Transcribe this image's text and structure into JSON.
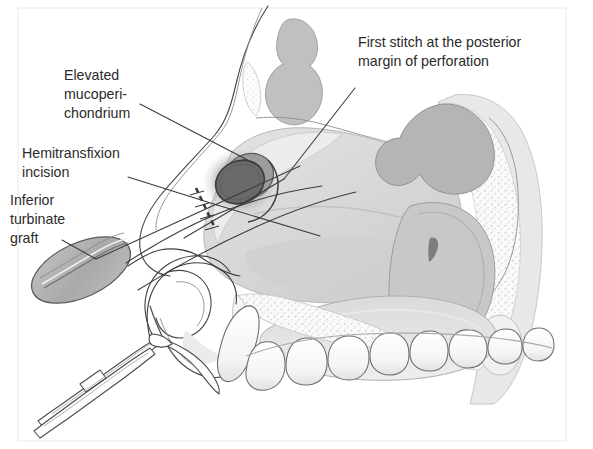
{
  "figure": {
    "background_color": "#ffffff",
    "width": 593,
    "height": 449
  },
  "palette": {
    "text": "#2b2b2b",
    "leader_line": "#3a3a3a",
    "outline": "#4a4a4a",
    "tissue_light": "#dcdcdc",
    "tissue_mid": "#c4c4c4",
    "tissue_dark": "#b0b0b0",
    "bone_speckle": "#efefef",
    "perforation_dark": "#5a5a5a",
    "graft_fill": "#aeaeae",
    "tooth_fill": "#fbfbfb",
    "frame": "#ebebeb"
  },
  "annotations": [
    {
      "id": "elevated-mucoperichondrium",
      "lines": [
        "Elevated",
        "mucoperi-",
        "chondrium"
      ],
      "text_anchor": "start",
      "x": 64,
      "y": 80,
      "line_height": 19,
      "leader": {
        "x1": 140,
        "y1": 104,
        "x2": 259,
        "y2": 166
      }
    },
    {
      "id": "first-stitch-posterior-margin",
      "lines": [
        "First stitch at the posterior",
        "margin of perforation"
      ],
      "text_anchor": "start",
      "x": 358,
      "y": 47,
      "line_height": 19,
      "leader": {
        "x1": 355,
        "y1": 88,
        "x2": 284,
        "y2": 179
      }
    },
    {
      "id": "hemitransfixion-incision",
      "lines": [
        "Hemitransfixion",
        "incision"
      ],
      "text_anchor": "start",
      "x": 22,
      "y": 158,
      "line_height": 19,
      "leader": {
        "x1": 128,
        "y1": 177,
        "x2": 217,
        "y2": 205
      }
    },
    {
      "id": "inferior-turbinate-graft",
      "lines": [
        "Inferior",
        "turbinate",
        "graft"
      ],
      "text_anchor": "start",
      "x": 10,
      "y": 205,
      "line_height": 19,
      "leader": {
        "x1": 62,
        "y1": 240,
        "x2": 96,
        "y2": 259
      }
    }
  ],
  "structures": [
    {
      "id": "facial-profile",
      "label": "facial soft tissue profile"
    },
    {
      "id": "frontal-sinus",
      "label": "frontal sinus"
    },
    {
      "id": "nasal-bone",
      "label": "nasal bone"
    },
    {
      "id": "nasal-septum",
      "label": "nasal septum"
    },
    {
      "id": "septal-perforation",
      "label": "septal perforation"
    },
    {
      "id": "mucoperichondrial-flap",
      "label": "elevated mucoperichondrial flap"
    },
    {
      "id": "sphenoid-sinus",
      "label": "sphenoid sinus"
    },
    {
      "id": "nasopharynx",
      "label": "nasopharynx"
    },
    {
      "id": "soft-palate",
      "label": "soft palate"
    },
    {
      "id": "hard-palate",
      "label": "hard palate"
    },
    {
      "id": "upper-teeth",
      "label": "upper dental arch"
    },
    {
      "id": "upper-lip",
      "label": "upper lip"
    },
    {
      "id": "columella",
      "label": "columella"
    },
    {
      "id": "inferior-turbinate-graft-body",
      "label": "harvested inferior turbinate graft"
    },
    {
      "id": "suture-thread",
      "label": "suture thread"
    },
    {
      "id": "curved-needle",
      "label": "curved surgical needle"
    },
    {
      "id": "needle-holder",
      "label": "needle holder forceps"
    },
    {
      "id": "incision-marking",
      "label": "dashed hemitransfixion incision marking"
    }
  ]
}
